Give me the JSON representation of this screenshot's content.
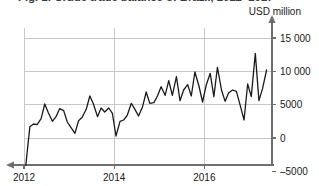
{
  "figure": {
    "title": "Fig. 1: Crude trade balance of Brazil, 2012–2017",
    "unit_label": "USD million",
    "background_color": "#ffffff",
    "line_color": "#1a1a1a",
    "grid_color": "#c8c8c8",
    "axis_color": "#6e6e6e"
  },
  "chart_data": {
    "type": "line",
    "title": "Fig. 1: Crude trade balance of Brazil, 2012–2017",
    "xlabel": "",
    "ylabel": "USD million",
    "ylim": [
      -5000,
      15000
    ],
    "xlim": [
      2012,
      2017.5
    ],
    "grid": true,
    "legend": null,
    "y_ticks": [
      -5000,
      0,
      5000,
      10000,
      15000
    ],
    "y_tick_labels": [
      "–5000",
      "0",
      "5000",
      "10 000",
      "15 000"
    ],
    "x_ticks": [
      2012,
      2014,
      2016
    ],
    "x_tick_labels": [
      "2012",
      "2014",
      "2016"
    ],
    "x": [
      2012.04,
      2012.13,
      2012.21,
      2012.29,
      2012.38,
      2012.46,
      2012.54,
      2012.63,
      2012.71,
      2012.79,
      2012.88,
      2012.96,
      2013.04,
      2013.13,
      2013.21,
      2013.29,
      2013.38,
      2013.46,
      2013.54,
      2013.63,
      2013.71,
      2013.79,
      2013.88,
      2013.96,
      2014.04,
      2014.13,
      2014.21,
      2014.29,
      2014.38,
      2014.46,
      2014.54,
      2014.63,
      2014.71,
      2014.79,
      2014.88,
      2014.96,
      2015.04,
      2015.13,
      2015.21,
      2015.29,
      2015.38,
      2015.46,
      2015.54,
      2015.63,
      2015.71,
      2015.79,
      2015.88,
      2015.96,
      2016.04,
      2016.13,
      2016.21,
      2016.29,
      2016.38,
      2016.46,
      2016.54,
      2016.63,
      2016.71,
      2016.79,
      2016.88,
      2016.96,
      2017.04,
      2017.13,
      2017.21,
      2017.29,
      2017.38
    ],
    "values": [
      -4100,
      1700,
      2100,
      2000,
      2900,
      5100,
      3800,
      2500,
      3200,
      4400,
      4100,
      2400,
      1600,
      700,
      2600,
      3100,
      4300,
      6300,
      5100,
      3200,
      4500,
      3900,
      4500,
      3700,
      300,
      2500,
      2700,
      3400,
      5200,
      4300,
      3300,
      4700,
      6900,
      5200,
      5300,
      6300,
      7700,
      6400,
      8600,
      6400,
      9200,
      5600,
      7200,
      8000,
      6300,
      9900,
      7800,
      5400,
      7900,
      9700,
      6200,
      10600,
      7200,
      5500,
      6800,
      7200,
      7000,
      5000,
      2700,
      8100,
      6200,
      12700,
      5600,
      7400,
      10200
    ],
    "series_name": "Crude trade balance"
  },
  "axes": {
    "y_axis_position": "right",
    "x_axis_arrow": "left",
    "y_axis_arrow": "up"
  }
}
